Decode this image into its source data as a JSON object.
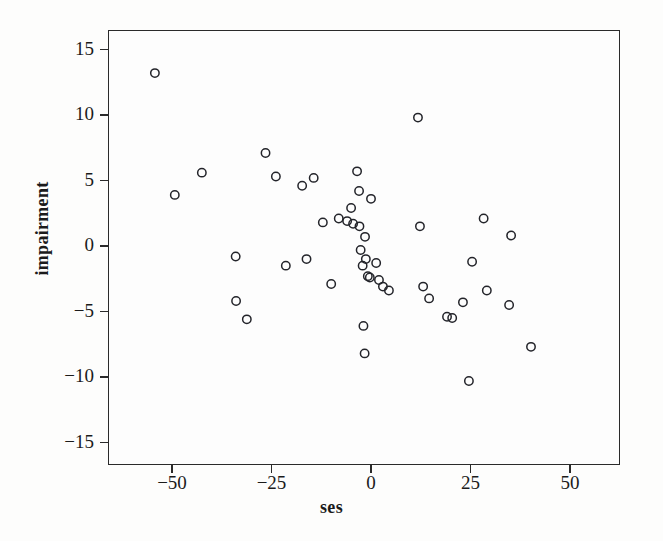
{
  "chart_data": {
    "type": "scatter",
    "title": "",
    "xlabel": "ses",
    "ylabel": "impairment",
    "xlim": [
      -68,
      62
    ],
    "ylim": [
      -18,
      16.5
    ],
    "xticks": [
      -50,
      -25,
      0,
      25,
      50
    ],
    "xtick_labels": [
      "−50",
      "−25",
      "0",
      "25",
      "50"
    ],
    "yticks": [
      15,
      10,
      5,
      0,
      -5,
      -10,
      -15
    ],
    "ytick_labels": [
      "15",
      "10",
      "5",
      "0",
      "−5",
      "−10",
      "−15"
    ],
    "grid": false,
    "legend": "none",
    "marker": "open-circle",
    "marker_color": "#23242a",
    "n_points": 47,
    "x": [
      -54.3,
      -42.5,
      -49.3,
      -34.0,
      -33.9,
      -31.2,
      -26.5,
      -23.9,
      -21.4,
      -17.3,
      -16.2,
      -14.4,
      -12.1,
      -10.0,
      -8.1,
      -6.0,
      -5.0,
      -4.5,
      -3.5,
      -3.0,
      -2.9,
      -2.6,
      -2.1,
      -1.9,
      -1.6,
      -1.5,
      -1.3,
      -0.8,
      -0.3,
      0.0,
      1.3,
      2.0,
      3.0,
      4.5,
      11.8,
      12.3,
      13.1,
      14.6,
      19.1,
      20.4,
      23.1,
      24.6,
      25.4,
      28.3,
      29.1,
      34.7,
      35.2,
      40.2,
      40.5
    ],
    "y": [
      13.2,
      5.6,
      3.9,
      -0.8,
      -4.2,
      -5.6,
      7.1,
      5.3,
      -1.5,
      4.6,
      -1.0,
      5.2,
      1.8,
      -2.9,
      2.1,
      1.9,
      2.9,
      1.7,
      5.7,
      4.2,
      1.5,
      -0.3,
      -1.5,
      -6.1,
      -8.2,
      0.7,
      -1.0,
      -2.3,
      -2.4,
      3.6,
      -1.3,
      -2.6,
      -3.1,
      -3.4,
      9.8,
      1.5,
      -3.1,
      -4.0,
      -5.4,
      -5.5,
      -4.3,
      -10.3,
      -1.2,
      2.1,
      -3.4,
      -4.5,
      0.8,
      -7.7
    ],
    "points": [
      {
        "x": -54.3,
        "y": 13.2
      },
      {
        "x": -49.3,
        "y": 3.9
      },
      {
        "x": -42.5,
        "y": 5.6
      },
      {
        "x": -34.0,
        "y": -0.8
      },
      {
        "x": -33.9,
        "y": -4.2
      },
      {
        "x": -31.2,
        "y": -5.6
      },
      {
        "x": -26.5,
        "y": 7.1
      },
      {
        "x": -23.9,
        "y": 5.3
      },
      {
        "x": -21.4,
        "y": -1.5
      },
      {
        "x": -17.3,
        "y": 4.6
      },
      {
        "x": -16.2,
        "y": -1.0
      },
      {
        "x": -14.4,
        "y": 5.2
      },
      {
        "x": -12.1,
        "y": 1.8
      },
      {
        "x": -10.0,
        "y": -2.9
      },
      {
        "x": -8.1,
        "y": 2.1
      },
      {
        "x": -6.0,
        "y": 1.9
      },
      {
        "x": -5.0,
        "y": 2.9
      },
      {
        "x": -4.5,
        "y": 1.7
      },
      {
        "x": -3.5,
        "y": 5.7
      },
      {
        "x": -3.0,
        "y": 4.2
      },
      {
        "x": -2.9,
        "y": 1.5
      },
      {
        "x": -2.6,
        "y": -0.3
      },
      {
        "x": -2.1,
        "y": -1.5
      },
      {
        "x": -1.9,
        "y": -6.1
      },
      {
        "x": -1.6,
        "y": -8.2
      },
      {
        "x": -1.5,
        "y": 0.7
      },
      {
        "x": -1.3,
        "y": -1.0
      },
      {
        "x": -0.8,
        "y": -2.3
      },
      {
        "x": -0.3,
        "y": -2.4
      },
      {
        "x": 0.0,
        "y": 3.6
      },
      {
        "x": 1.3,
        "y": -1.3
      },
      {
        "x": 2.0,
        "y": -2.6
      },
      {
        "x": 3.0,
        "y": -3.1
      },
      {
        "x": 4.5,
        "y": -3.4
      },
      {
        "x": 11.8,
        "y": 9.8
      },
      {
        "x": 12.3,
        "y": 1.5
      },
      {
        "x": 13.1,
        "y": -3.1
      },
      {
        "x": 14.6,
        "y": -4.0
      },
      {
        "x": 19.1,
        "y": -5.4
      },
      {
        "x": 20.4,
        "y": -5.5
      },
      {
        "x": 23.1,
        "y": -4.3
      },
      {
        "x": 24.6,
        "y": -10.3
      },
      {
        "x": 25.4,
        "y": -1.2
      },
      {
        "x": 28.3,
        "y": 2.1
      },
      {
        "x": 29.1,
        "y": -3.4
      },
      {
        "x": 34.7,
        "y": -4.5
      },
      {
        "x": 35.2,
        "y": 0.8
      },
      {
        "x": 40.2,
        "y": -7.7
      }
    ]
  },
  "axes": {
    "x_label": "ses",
    "y_label": "impairment"
  }
}
